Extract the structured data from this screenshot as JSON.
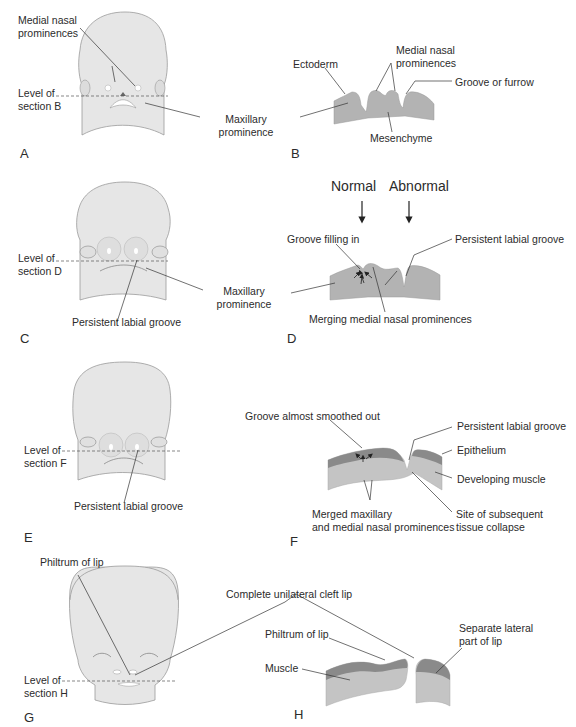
{
  "colors": {
    "head_fill": "#e6e6e6",
    "head_stroke": "#9a9a9a",
    "tissue_fill": "#b3b3b3",
    "epithelium_fill": "#8a8a8a",
    "muscle_fill": "#c4c4c4",
    "leader_line": "#333333"
  },
  "panels": {
    "A": {
      "letter": "A",
      "labels": {
        "medial_nasal_1": "Medial nasal",
        "medial_nasal_2": "prominences",
        "level_1": "Level of",
        "level_2": "section B",
        "maxillary_1": "Maxillary",
        "maxillary_2": "prominence"
      }
    },
    "B": {
      "letter": "B",
      "labels": {
        "ectoderm": "Ectoderm",
        "medial_nasal_1": "Medial nasal",
        "medial_nasal_2": "prominences",
        "groove": "Groove or furrow",
        "mesenchyme": "Mesenchyme"
      }
    },
    "C": {
      "letter": "C",
      "labels": {
        "level_1": "Level of",
        "level_2": "section D",
        "persistent": "Persistent labial groove",
        "maxillary_1": "Maxillary",
        "maxillary_2": "prominence"
      }
    },
    "D": {
      "letter": "D",
      "labels": {
        "normal": "Normal",
        "abnormal": "Abnormal",
        "groove_filling": "Groove filling in",
        "persistent": "Persistent labial groove",
        "merging": "Merging medial nasal prominences"
      }
    },
    "E": {
      "letter": "E",
      "labels": {
        "level_1": "Level of",
        "level_2": "section F",
        "persistent": "Persistent labial groove"
      }
    },
    "F": {
      "letter": "F",
      "labels": {
        "smoothed": "Groove almost smoothed out",
        "persistent": "Persistent labial groove",
        "epithelium": "Epithelium",
        "muscle": "Developing muscle",
        "merged_1": "Merged maxillary",
        "merged_2": "and medial nasal prominences",
        "collapse_1": "Site of subsequent",
        "collapse_2": "tissue collapse"
      }
    },
    "G": {
      "letter": "G",
      "labels": {
        "philtrum": "Philtrum of lip",
        "level_1": "Level of",
        "level_2": "section H",
        "cleft": "Complete unilateral cleft lip"
      }
    },
    "H": {
      "letter": "H",
      "labels": {
        "philtrum": "Philtrum of lip",
        "muscle": "Muscle",
        "separate_1": "Separate lateral",
        "separate_2": "part of lip"
      }
    }
  }
}
